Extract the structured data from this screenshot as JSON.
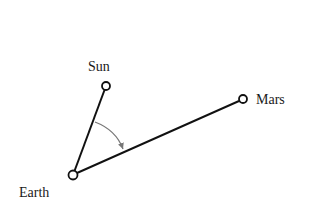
{
  "diagram": {
    "type": "geometry",
    "colors": {
      "line": "#111111",
      "arc": "#777777",
      "background": "#ffffff"
    },
    "nodes": [
      {
        "id": "sun",
        "label": "Sun",
        "x": 106,
        "y": 86
      },
      {
        "id": "earth",
        "label": "Earth",
        "x": 73,
        "y": 175
      },
      {
        "id": "mars",
        "label": "Mars",
        "x": 243,
        "y": 99
      }
    ],
    "edges": [
      {
        "from": "earth",
        "to": "sun"
      },
      {
        "from": "earth",
        "to": "mars"
      }
    ],
    "angle": {
      "vertex": "earth",
      "from": "sun",
      "to": "mars",
      "arrow": true
    }
  },
  "labels": {
    "sun": "Sun",
    "earth": "Earth",
    "mars": "Mars"
  }
}
